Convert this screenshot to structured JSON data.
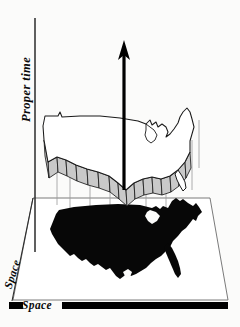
{
  "figure": {
    "background_color": "#fbfbfa",
    "ink_color": "#0a0a0a"
  },
  "axes": {
    "vertical": {
      "label": "Proper time",
      "name": "proper-time-axis",
      "orientation": "vertical",
      "line_color": "#2b2b2b"
    },
    "depth": {
      "label": "Space",
      "name": "space-axis-depth",
      "orientation": "diagonal",
      "line_color": "#2b2b2b"
    },
    "horizontal": {
      "label": "Space",
      "name": "space-axis-horizontal",
      "orientation": "horizontal",
      "line_color": "#000000"
    }
  },
  "arrow": {
    "name": "worldline-arrow",
    "direction": "up",
    "color": "#000000"
  },
  "ground_plane": {
    "name": "space-plane",
    "shape": "parallelogram",
    "edge_color": "#6b6b6b"
  },
  "maps": {
    "silhouette": {
      "name": "usa-silhouette-map",
      "fill": "#070707",
      "caption": "Filled United States outline lying in the space plane"
    },
    "outline": {
      "name": "usa-outline-map",
      "stroke": "#1a1a1a",
      "fill": "#ffffff",
      "caption": "Raised United States outline at a later proper time"
    },
    "extrusion": {
      "name": "usa-border-extrusion",
      "fill": "#c9c9c9",
      "stroke": "#1c1c1c",
      "caption": "Shaded southern border wall connecting the two slices"
    }
  },
  "projection_lines": {
    "name": "projection-lines",
    "color": "#8a8a8a",
    "count": 8
  }
}
